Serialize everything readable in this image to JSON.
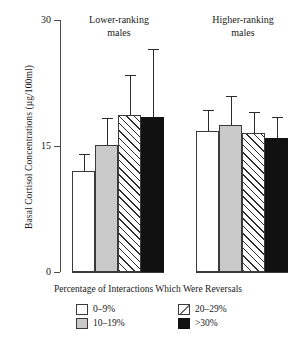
{
  "chart_data": {
    "type": "bar",
    "title": "",
    "xlabel": "Percentage of Interactions Which Were Reversals",
    "ylabel": "Basal Cortisol Concentrations (µg/100ml)",
    "ylim": [
      0,
      30
    ],
    "yticks": [
      0,
      15,
      30
    ],
    "ytick_labels": [
      "0",
      "15",
      "30"
    ],
    "grid": false,
    "legend_position": "bottom",
    "categories": [
      "Lower-ranking males",
      "Higher-ranking males"
    ],
    "series": [
      {
        "name": "0–9%",
        "fill": "white",
        "values": [
          12.0,
          16.8
        ],
        "errors_upper": [
          14.0,
          19.3
        ]
      },
      {
        "name": "10–19%",
        "fill": "grey",
        "values": [
          15.1,
          17.5
        ],
        "errors_upper": [
          18.3,
          21.0
        ]
      },
      {
        "name": "20–29%",
        "fill": "hatch",
        "values": [
          18.7,
          16.5
        ],
        "errors_upper": [
          23.5,
          19.0
        ]
      },
      {
        "name": "&gt;30%",
        "fill": "black",
        "values": [
          18.4,
          16.0
        ],
        "errors_upper": [
          26.6,
          18.5
        ]
      }
    ]
  },
  "axis": {
    "y_title": "Basal Cortisol Concentrations (µg/100ml)",
    "x_title": "Percentage of Interactions Which Were Reversals",
    "y_ticks": [
      "30",
      "15",
      "0"
    ]
  },
  "groups": [
    {
      "line1": "Lower-ranking",
      "line2": "males"
    },
    {
      "line1": "Higher-ranking",
      "line2": "males"
    }
  ],
  "legend": {
    "items": [
      {
        "label": "0–9%",
        "swatch": "swatch-white"
      },
      {
        "label": "20–29%",
        "swatch": "swatch-hatch"
      },
      {
        "label": "10–19%",
        "swatch": "swatch-grey"
      },
      {
        "label": ">30%",
        "swatch": "swatch-black"
      }
    ]
  },
  "colors": {
    "white": "#ffffff",
    "grey": "#c9c9c9",
    "black": "#111111",
    "hatch_line": "#2b2b2b",
    "axis": "#4a4a4a",
    "text": "#1a1a1a"
  }
}
